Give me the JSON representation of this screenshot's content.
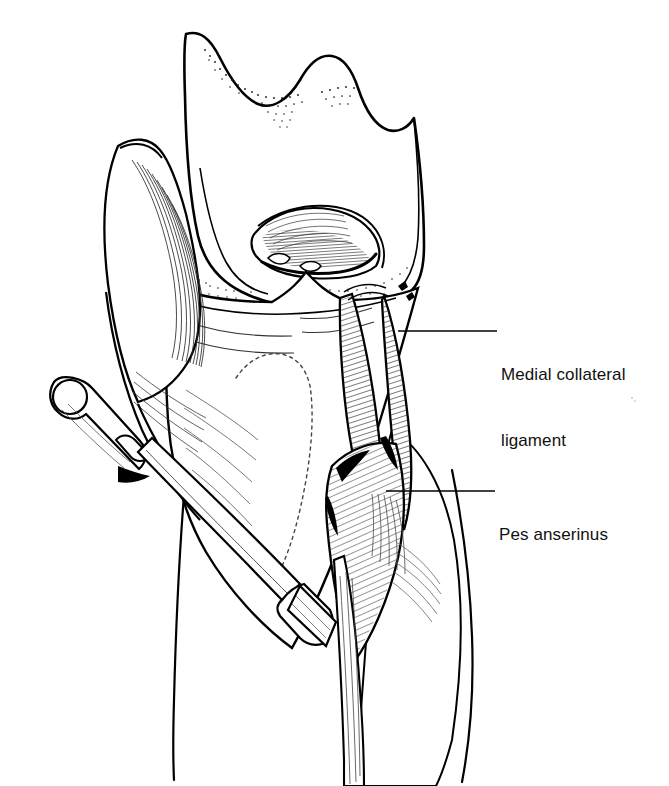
{
  "figure": {
    "kind": "anatomical-line-illustration",
    "background_color": "#ffffff",
    "ink_color": "#000000",
    "width": 669,
    "height": 786
  },
  "labels": [
    {
      "id": "medial-collateral-ligament",
      "line1": "Medial collateral",
      "line2": "ligament",
      "text_x": 501,
      "text_y": 320,
      "leader": {
        "x1": 398,
        "y1": 331,
        "x2": 497,
        "y2": 331
      }
    },
    {
      "id": "pes-anserinus",
      "line1": "Pes anserinus",
      "line2": "",
      "text_x": 499,
      "text_y": 480,
      "leader": {
        "x1": 386,
        "y1": 491,
        "x2": 495,
        "y2": 491
      }
    }
  ],
  "structures": [
    {
      "name": "femur-distal",
      "description": "distal femur with medial and lateral condyles"
    },
    {
      "name": "femoral-trochlea",
      "description": "stippled trochlear groove margin"
    },
    {
      "name": "intercondylar-notch",
      "description": "densely hatched notch with cruciate stumps"
    },
    {
      "name": "tibial-plateau",
      "description": "proximal tibia articular surface"
    },
    {
      "name": "tibial-tuberosity",
      "description": "anterior tibial prominence, dotted outline"
    },
    {
      "name": "medial-collateral-ligament",
      "description": "vertical hatched band on medial side"
    },
    {
      "name": "pes-anserinus",
      "description": "conjoined tendon fanning to medial tibia"
    },
    {
      "name": "medial-retinaculum",
      "description": "flowing fiber sheet on medial/left aspect"
    },
    {
      "name": "surgical-retractor",
      "description": "cylindrical handle with flat angled blade"
    },
    {
      "name": "tibial-shaft",
      "description": "lower tibia extending to bottom of frame"
    }
  ]
}
